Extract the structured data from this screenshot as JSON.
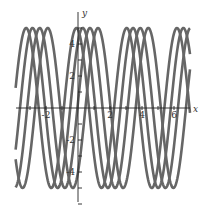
{
  "chart_data": {
    "type": "line",
    "title": "",
    "xlabel": "x",
    "ylabel": "y",
    "xlim": [
      -3.9,
      7.0
    ],
    "ylim": [
      -6,
      6
    ],
    "x_ticks": [
      -2,
      2,
      4,
      6
    ],
    "y_ticks": [
      -4,
      -2,
      2,
      4
    ],
    "x_tick_labels": [
      "-2",
      "2",
      "4",
      "6"
    ],
    "y_tick_labels": [
      "-4",
      "-2",
      "2",
      "4"
    ],
    "grid": false,
    "legend": null,
    "line_color": "#666666",
    "series": [
      {
        "name": "curve-1",
        "formula": "5*sin(2x+1.77)",
        "amplitude": 5,
        "frequency": 2,
        "phase": 1.77
      },
      {
        "name": "curve-2",
        "formula": "5*sin(2x+0.97)",
        "amplitude": 5,
        "frequency": 2,
        "phase": 0.97
      },
      {
        "name": "curve-3",
        "formula": "5*sin(2x+0.07)",
        "amplitude": 5,
        "frequency": 2,
        "phase": 0.07
      },
      {
        "name": "curve-4",
        "formula": "5*sin(2x-0.93)",
        "amplitude": 5,
        "frequency": 2,
        "phase": -0.93
      }
    ]
  },
  "layout": {
    "origin_px": [
      78,
      108
    ],
    "unit_px": 16
  }
}
